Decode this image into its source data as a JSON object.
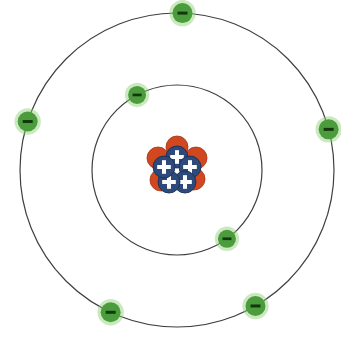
{
  "diagram": {
    "kind": "bohr-atomic-model",
    "title": "",
    "background_color": "#ffffff",
    "center": {
      "x": 177,
      "y": 170
    },
    "colors": {
      "orbit_stroke": "#3f3f42",
      "electron_fill": "#4a9c3c",
      "electron_glow": "#8ccf6e",
      "electron_sign": "#14380e",
      "proton_fill": "#2d4a7a",
      "proton_edge": "#1b2f52",
      "proton_sign": "#ffffff",
      "neutron_fill": "#d14820",
      "neutron_edge": "#a83413"
    },
    "orbits": [
      {
        "name": "inner-shell",
        "radius": 85,
        "stroke_width": 1.2,
        "electron_count": 2
      },
      {
        "name": "outer-shell",
        "radius": 157,
        "stroke_width": 1.2,
        "electron_count": 5
      }
    ],
    "electrons": [
      {
        "id": "electron-inner-1",
        "shell": "inner-shell",
        "radius": 85,
        "angle_deg": 118,
        "symbol": "-",
        "charge": "negative",
        "r": 9
      },
      {
        "id": "electron-inner-2",
        "shell": "inner-shell",
        "radius": 85,
        "angle_deg": -54,
        "symbol": "-",
        "charge": "negative",
        "r": 9
      },
      {
        "id": "electron-outer-1",
        "shell": "outer-shell",
        "radius": 157,
        "angle_deg": 88,
        "symbol": "-",
        "charge": "negative",
        "r": 10
      },
      {
        "id": "electron-outer-2",
        "shell": "outer-shell",
        "radius": 157,
        "angle_deg": 162,
        "symbol": "-",
        "charge": "negative",
        "r": 10
      },
      {
        "id": "electron-outer-3",
        "shell": "outer-shell",
        "radius": 157,
        "angle_deg": 15,
        "symbol": "-",
        "charge": "negative",
        "r": 10
      },
      {
        "id": "electron-outer-4",
        "shell": "outer-shell",
        "radius": 157,
        "angle_deg": -60,
        "symbol": "-",
        "charge": "negative",
        "r": 10
      },
      {
        "id": "electron-outer-5",
        "shell": "outer-shell",
        "radius": 157,
        "angle_deg": -115,
        "symbol": "-",
        "charge": "negative",
        "r": 10
      }
    ],
    "nucleus": {
      "name": "nucleus",
      "proton_count": 5,
      "neutron_count": 5,
      "proton_symbol": "+",
      "neutron_symbol": "",
      "particle_radius": 11,
      "cluster_radius": 13,
      "protons": [
        {
          "id": "proton-1",
          "x": 177,
          "y": 157,
          "symbol": "+"
        },
        {
          "id": "proton-2",
          "x": 190,
          "y": 167,
          "symbol": "+"
        },
        {
          "id": "proton-3",
          "x": 185,
          "y": 182,
          "symbol": "+"
        },
        {
          "id": "proton-4",
          "x": 169,
          "y": 182,
          "symbol": "+"
        },
        {
          "id": "proton-5",
          "x": 164,
          "y": 167,
          "symbol": "+"
        }
      ],
      "neutrons": [
        {
          "id": "neutron-1",
          "x": 177,
          "y": 147,
          "symbol": ""
        },
        {
          "id": "neutron-2",
          "x": 196,
          "y": 158,
          "symbol": ""
        },
        {
          "id": "neutron-3",
          "x": 194,
          "y": 179,
          "symbol": ""
        },
        {
          "id": "neutron-4",
          "x": 161,
          "y": 180,
          "symbol": ""
        },
        {
          "id": "neutron-5",
          "x": 158,
          "y": 158,
          "symbol": ""
        }
      ]
    }
  }
}
